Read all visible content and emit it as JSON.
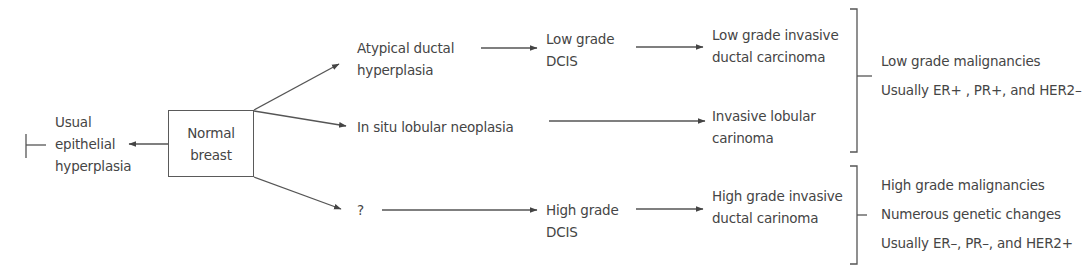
{
  "colors": {
    "text": "#454545",
    "line": "#555555",
    "background": "#ffffff"
  },
  "root": {
    "lines": [
      "Normal",
      "breast"
    ]
  },
  "left_branch": {
    "lines": [
      "Usual",
      "epithelial",
      "hyperplasia"
    ],
    "end_marker": "inhibition-bar"
  },
  "pathways": [
    {
      "id": "low-grade-ductal",
      "stages": [
        {
          "lines": [
            "Atypical ductal",
            "hyperplasia"
          ]
        },
        {
          "lines": [
            "Low grade",
            "DCIS"
          ]
        },
        {
          "lines": [
            "Low grade invasive",
            "ductal carcinoma"
          ]
        }
      ]
    },
    {
      "id": "lobular",
      "stages": [
        {
          "lines": [
            "In situ lobular neoplasia"
          ]
        },
        {
          "lines": [
            "Invasive lobular",
            "carinoma"
          ]
        }
      ]
    },
    {
      "id": "high-grade-ductal",
      "stages": [
        {
          "lines": [
            "?"
          ]
        },
        {
          "lines": [
            "High grade",
            "DCIS"
          ]
        },
        {
          "lines": [
            "High grade invasive",
            "ductal carinoma"
          ]
        }
      ]
    }
  ],
  "groups": [
    {
      "id": "low-grade-group",
      "lines": [
        "Low grade malignancies",
        "Usually ER+ , PR+, and HER2–"
      ]
    },
    {
      "id": "high-grade-group",
      "lines": [
        "High grade malignancies",
        "Numerous genetic changes",
        "Usually ER–, PR–, and HER2+"
      ]
    }
  ]
}
